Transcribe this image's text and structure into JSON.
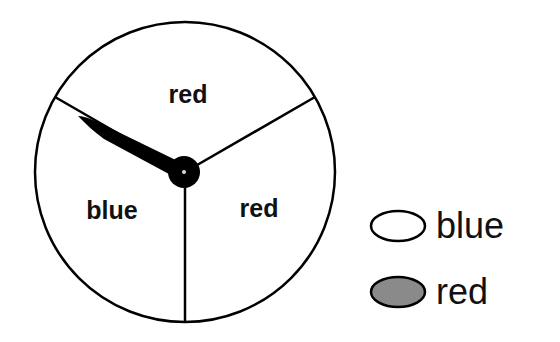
{
  "spinner": {
    "sectors": [
      {
        "label": "red",
        "position": "top"
      },
      {
        "label": "blue",
        "position": "bottom-left"
      },
      {
        "label": "red",
        "position": "bottom-right"
      }
    ],
    "pointer": {
      "points_to": "boundary between blue and top red sector (upper-left)"
    },
    "colors": {
      "outline": "#000000",
      "fill": "#ffffff",
      "pointer": "#000000"
    }
  },
  "legend": {
    "items": [
      {
        "label": "blue",
        "swatch_fill": "#ffffff"
      },
      {
        "label": "red",
        "swatch_fill": "#8a8a8a"
      }
    ]
  }
}
